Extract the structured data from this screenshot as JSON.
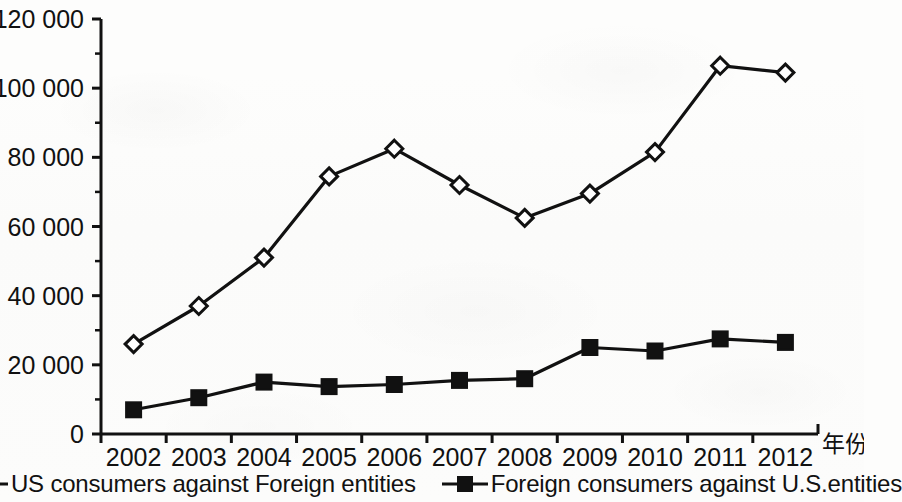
{
  "chart_data": {
    "type": "line",
    "title": "",
    "subtitle": "",
    "xlabel": "年份",
    "ylabel": "",
    "categories": [
      "2002",
      "2003",
      "2004",
      "2005",
      "2006",
      "2007",
      "2008",
      "2009",
      "2010",
      "2011",
      "2012"
    ],
    "x_tick_labels": [
      "2002",
      "2003",
      "2004",
      "2005",
      "2006",
      "2007",
      "2008",
      "2009",
      "2010",
      "2011",
      "2012"
    ],
    "y_tick_labels": [
      "0",
      "20 000",
      "40 000",
      "60 000",
      "80 000",
      "100 000",
      "120 000"
    ],
    "y_tick_values": [
      0,
      20000,
      40000,
      60000,
      80000,
      100000,
      120000
    ],
    "ylim": [
      0,
      120000
    ],
    "y_minor_ticks": [
      10000,
      30000,
      50000,
      70000,
      90000,
      110000
    ],
    "grid": false,
    "legend_position": "bottom",
    "series": [
      {
        "name": "US consumers against Foreign entities",
        "marker": "open-diamond",
        "color": "#111111",
        "values": [
          26000,
          37000,
          51000,
          74500,
          82500,
          72000,
          62500,
          69500,
          81500,
          106500,
          104500
        ]
      },
      {
        "name": "Foreign consumers against U.S.entities",
        "marker": "filled-square",
        "color": "#111111",
        "values": [
          7000,
          10500,
          15000,
          13700,
          14300,
          15500,
          16000,
          25000,
          24000,
          27500,
          26500
        ]
      }
    ],
    "annotations": []
  },
  "legend": {
    "entries": [
      {
        "label": "US consumers against Foreign entities",
        "marker": "open-diamond-marker"
      },
      {
        "label": "Foreign consumers against U.S.entities",
        "marker": "filled-square-marker"
      }
    ]
  }
}
